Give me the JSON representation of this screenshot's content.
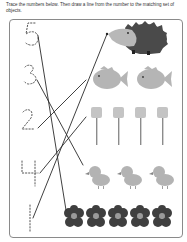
{
  "worksheet": {
    "instructions": "Trace the numbers below. Then draw a line from the number to the matching set of objects.",
    "numbers": [
      {
        "value": "5",
        "label": "number-5"
      },
      {
        "value": "3",
        "label": "number-3"
      },
      {
        "value": "2",
        "label": "number-2"
      },
      {
        "value": "4",
        "label": "number-4"
      },
      {
        "value": "1",
        "label": "number-1"
      }
    ],
    "object_sets": [
      {
        "name": "hedgehog",
        "count": 1
      },
      {
        "name": "fish",
        "count": 2
      },
      {
        "name": "marshmallow",
        "count": 4
      },
      {
        "name": "chick",
        "count": 3
      },
      {
        "name": "flower",
        "count": 5
      }
    ],
    "drawn_lines": [
      {
        "from": "5",
        "to": "flower"
      },
      {
        "from": "3",
        "to": "chick"
      },
      {
        "from": "2",
        "to": "fish"
      },
      {
        "from": "4",
        "to": "marshmallow"
      },
      {
        "from": "1",
        "to": "hedgehog"
      }
    ],
    "colors": {
      "line": "#2a2a2a",
      "dotted_number": "#555555",
      "hedgehog_body": "#4a4a4a",
      "hedgehog_face": "#b8b8b8",
      "fish": "#b5b5b5",
      "marshmallow": "#c4c4c4",
      "stick": "#8c8c8c",
      "chick": "#b3b3b3",
      "flower_petal": "#3f3f3f",
      "flower_center": "#9a9a9a",
      "frame": "#8a8a8a"
    }
  }
}
